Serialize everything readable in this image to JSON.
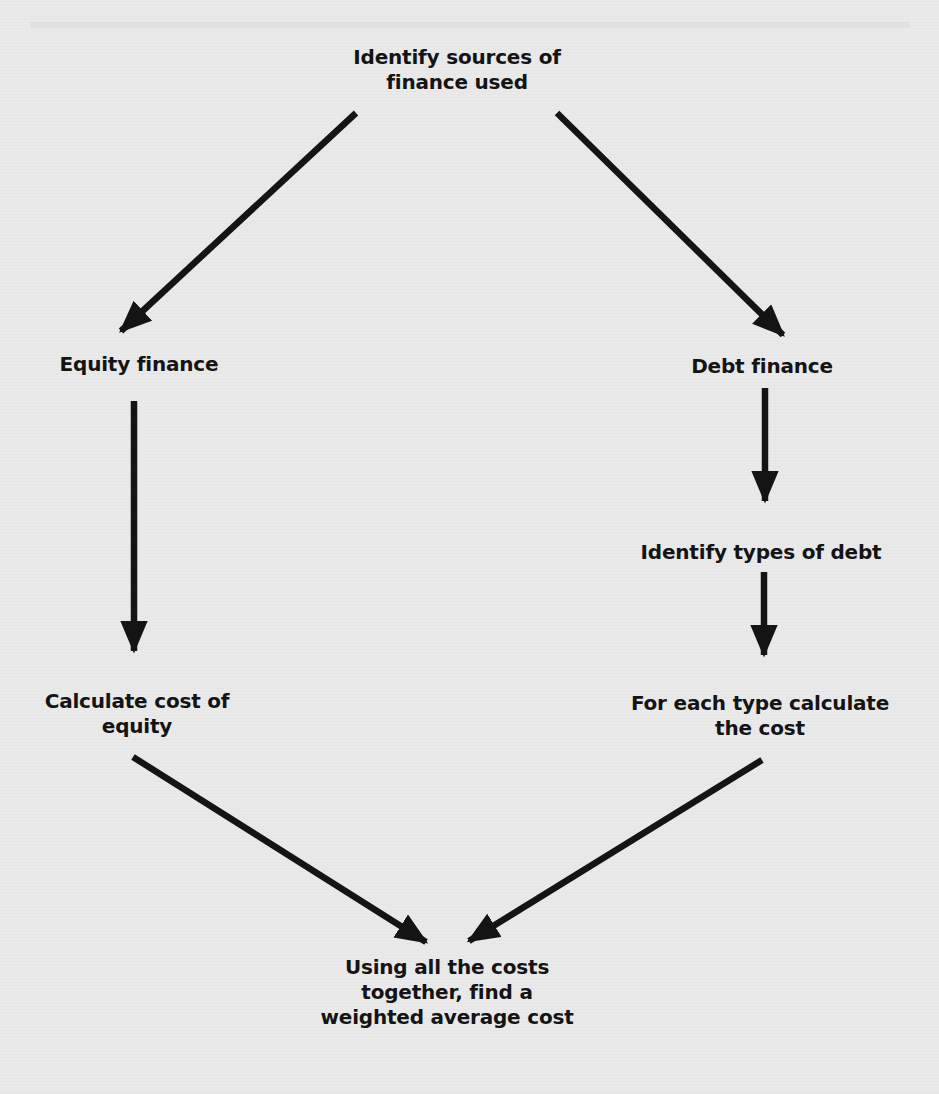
{
  "diagram": {
    "type": "flowchart",
    "colors": {
      "background": "#e9e9e9",
      "ink": "#141414"
    },
    "nodes": {
      "sources": {
        "lines": [
          "Identify sources of",
          "finance used"
        ]
      },
      "equity": {
        "lines": [
          "Equity finance"
        ]
      },
      "debt": {
        "lines": [
          "Debt finance"
        ]
      },
      "debt_types": {
        "lines": [
          "Identify types of debt"
        ]
      },
      "cost_equity": {
        "lines": [
          "Calculate cost of",
          "equity"
        ]
      },
      "cost_debt": {
        "lines": [
          "For each type calculate",
          "the cost"
        ]
      },
      "wacc": {
        "lines": [
          "Using all the costs",
          "together, find a",
          "weighted average cost"
        ]
      }
    },
    "edges": [
      {
        "from": "sources",
        "to": "equity"
      },
      {
        "from": "sources",
        "to": "debt"
      },
      {
        "from": "equity",
        "to": "cost_equity"
      },
      {
        "from": "debt",
        "to": "debt_types"
      },
      {
        "from": "debt_types",
        "to": "cost_debt"
      },
      {
        "from": "cost_equity",
        "to": "wacc"
      },
      {
        "from": "cost_debt",
        "to": "wacc"
      }
    ]
  }
}
